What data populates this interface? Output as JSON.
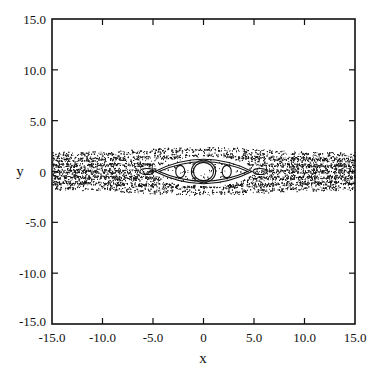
{
  "chart_data": {
    "type": "scatter",
    "title": "",
    "xlabel": "x",
    "ylabel": "y",
    "xlim": [
      -15.0,
      15.0
    ],
    "ylim": [
      -15.0,
      15.0
    ],
    "xticks": [
      -15.0,
      -10.0,
      -5.0,
      0,
      5.0,
      10.0,
      15.0
    ],
    "xtick_labels": [
      "-15.0",
      "-10.0",
      "-5.0",
      "0",
      "5.0",
      "10.0",
      "15.0"
    ],
    "yticks": [
      -15.0,
      -10.0,
      -5.0,
      0,
      5.0,
      10.0,
      15.0
    ],
    "ytick_labels": [
      "-15.0",
      "-10.0",
      "-5.0",
      "0",
      "5.0",
      "10.0",
      "15.0"
    ],
    "grid": false,
    "legend": null,
    "series": [
      {
        "name": "chaotic-band",
        "kind": "scatter-dots",
        "half_width_center": 2.2,
        "half_width_edge": 1.7
      },
      {
        "name": "central-island",
        "kind": "closed-curves",
        "center": [
          0,
          0
        ],
        "curves": [
          {
            "rx": 1.2,
            "ry": 1.1
          },
          {
            "rx": 1.0,
            "ry": 0.9
          }
        ]
      },
      {
        "name": "separatrix-eye",
        "kind": "closed-curves",
        "center": [
          0,
          0
        ],
        "curves": [
          {
            "rx": 4.8,
            "ry": 1.5
          },
          {
            "rx": 4.4,
            "ry": 1.2
          }
        ]
      },
      {
        "name": "satellite-islands",
        "kind": "closed-curves",
        "islands": [
          {
            "center": [
              -2.3,
              0
            ],
            "rx": 0.45,
            "ry": 0.6
          },
          {
            "center": [
              2.3,
              0
            ],
            "rx": 0.45,
            "ry": 0.6
          },
          {
            "center": [
              -5.6,
              0
            ],
            "rx": 0.7,
            "ry": 0.3
          },
          {
            "center": [
              5.6,
              0
            ],
            "rx": 0.7,
            "ry": 0.3
          }
        ]
      }
    ]
  }
}
